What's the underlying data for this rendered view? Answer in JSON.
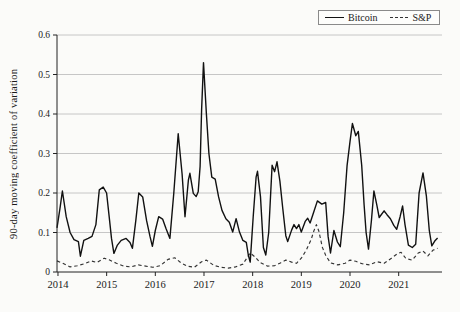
{
  "colors": {
    "background": "#fbfbf9",
    "bitcoin_line": "#111111",
    "sp_line": "#333333",
    "grid": "#c6c6c6",
    "axis": "#222222",
    "tick_text": "#1a1a1a",
    "legend_border": "#8a8a8a"
  },
  "chart_data": {
    "type": "line",
    "title": "",
    "xlabel": "",
    "ylabel": "90-day moving coefficient of variation",
    "xlim": [
      2013.98,
      2021.89
    ],
    "ylim": [
      0,
      0.6
    ],
    "x_ticks": [
      2014,
      2015,
      2016,
      2017,
      2018,
      2019,
      2020,
      2021
    ],
    "x_tick_labels": [
      "2014",
      "2015",
      "2016",
      "2017",
      "2018",
      "2019",
      "2020",
      "2021"
    ],
    "y_ticks": [
      0,
      0.1,
      0.2,
      0.3,
      0.4,
      0.5,
      0.6
    ],
    "y_tick_labels": [
      "0",
      "0.1",
      "0.2",
      "0.3",
      "0.4",
      "0.5",
      "0.6"
    ],
    "grid": "horizontal",
    "legend": {
      "position": "top-right",
      "entries": [
        {
          "label": "Bitcoin",
          "style": "solid"
        },
        {
          "label": "S&P",
          "style": "dashed"
        }
      ]
    },
    "series": [
      {
        "name": "S&P",
        "style": "dashed",
        "points": [
          [
            2013.98,
            0.028
          ],
          [
            2014.1,
            0.022
          ],
          [
            2014.25,
            0.013
          ],
          [
            2014.4,
            0.016
          ],
          [
            2014.55,
            0.021
          ],
          [
            2014.68,
            0.028
          ],
          [
            2014.8,
            0.024
          ],
          [
            2014.95,
            0.035
          ],
          [
            2015.05,
            0.031
          ],
          [
            2015.2,
            0.022
          ],
          [
            2015.35,
            0.015
          ],
          [
            2015.5,
            0.013
          ],
          [
            2015.65,
            0.018
          ],
          [
            2015.8,
            0.015
          ],
          [
            2015.95,
            0.012
          ],
          [
            2016.1,
            0.016
          ],
          [
            2016.26,
            0.032
          ],
          [
            2016.4,
            0.036
          ],
          [
            2016.52,
            0.024
          ],
          [
            2016.65,
            0.015
          ],
          [
            2016.8,
            0.012
          ],
          [
            2016.95,
            0.026
          ],
          [
            2017.05,
            0.03
          ],
          [
            2017.2,
            0.017
          ],
          [
            2017.35,
            0.012
          ],
          [
            2017.5,
            0.01
          ],
          [
            2017.65,
            0.013
          ],
          [
            2017.8,
            0.02
          ],
          [
            2017.95,
            0.048
          ],
          [
            2018.05,
            0.038
          ],
          [
            2018.15,
            0.024
          ],
          [
            2018.3,
            0.015
          ],
          [
            2018.45,
            0.016
          ],
          [
            2018.57,
            0.023
          ],
          [
            2018.68,
            0.03
          ],
          [
            2018.8,
            0.025
          ],
          [
            2018.9,
            0.022
          ],
          [
            2019.0,
            0.035
          ],
          [
            2019.1,
            0.055
          ],
          [
            2019.2,
            0.082
          ],
          [
            2019.26,
            0.105
          ],
          [
            2019.31,
            0.12
          ],
          [
            2019.36,
            0.103
          ],
          [
            2019.43,
            0.063
          ],
          [
            2019.5,
            0.042
          ],
          [
            2019.6,
            0.023
          ],
          [
            2019.75,
            0.018
          ],
          [
            2019.9,
            0.022
          ],
          [
            2020.0,
            0.03
          ],
          [
            2020.12,
            0.027
          ],
          [
            2020.25,
            0.021
          ],
          [
            2020.4,
            0.018
          ],
          [
            2020.55,
            0.026
          ],
          [
            2020.7,
            0.022
          ],
          [
            2020.85,
            0.035
          ],
          [
            2020.97,
            0.046
          ],
          [
            2021.05,
            0.05
          ],
          [
            2021.15,
            0.034
          ],
          [
            2021.28,
            0.03
          ],
          [
            2021.4,
            0.048
          ],
          [
            2021.5,
            0.053
          ],
          [
            2021.6,
            0.041
          ],
          [
            2021.7,
            0.055
          ],
          [
            2021.8,
            0.06
          ]
        ]
      },
      {
        "name": "Bitcoin",
        "style": "solid",
        "points": [
          [
            2013.98,
            0.112
          ],
          [
            2014.04,
            0.16
          ],
          [
            2014.09,
            0.205
          ],
          [
            2014.17,
            0.14
          ],
          [
            2014.25,
            0.1
          ],
          [
            2014.33,
            0.082
          ],
          [
            2014.42,
            0.077
          ],
          [
            2014.46,
            0.04
          ],
          [
            2014.53,
            0.08
          ],
          [
            2014.62,
            0.085
          ],
          [
            2014.7,
            0.09
          ],
          [
            2014.78,
            0.12
          ],
          [
            2014.85,
            0.208
          ],
          [
            2014.93,
            0.215
          ],
          [
            2015.0,
            0.2
          ],
          [
            2015.06,
            0.13
          ],
          [
            2015.1,
            0.085
          ],
          [
            2015.15,
            0.047
          ],
          [
            2015.22,
            0.068
          ],
          [
            2015.3,
            0.08
          ],
          [
            2015.4,
            0.085
          ],
          [
            2015.48,
            0.075
          ],
          [
            2015.53,
            0.06
          ],
          [
            2015.6,
            0.13
          ],
          [
            2015.66,
            0.2
          ],
          [
            2015.74,
            0.19
          ],
          [
            2015.82,
            0.13
          ],
          [
            2015.89,
            0.09
          ],
          [
            2015.94,
            0.065
          ],
          [
            2016.0,
            0.105
          ],
          [
            2016.07,
            0.14
          ],
          [
            2016.15,
            0.134
          ],
          [
            2016.22,
            0.11
          ],
          [
            2016.3,
            0.085
          ],
          [
            2016.38,
            0.2
          ],
          [
            2016.47,
            0.35
          ],
          [
            2016.55,
            0.248
          ],
          [
            2016.61,
            0.14
          ],
          [
            2016.68,
            0.233
          ],
          [
            2016.71,
            0.25
          ],
          [
            2016.78,
            0.199
          ],
          [
            2016.84,
            0.191
          ],
          [
            2016.88,
            0.203
          ],
          [
            2016.92,
            0.267
          ],
          [
            2016.95,
            0.41
          ],
          [
            2016.99,
            0.53
          ],
          [
            2017.05,
            0.4
          ],
          [
            2017.1,
            0.3
          ],
          [
            2017.16,
            0.24
          ],
          [
            2017.23,
            0.235
          ],
          [
            2017.3,
            0.19
          ],
          [
            2017.37,
            0.156
          ],
          [
            2017.45,
            0.135
          ],
          [
            2017.52,
            0.126
          ],
          [
            2017.59,
            0.101
          ],
          [
            2017.66,
            0.135
          ],
          [
            2017.73,
            0.101
          ],
          [
            2017.8,
            0.08
          ],
          [
            2017.87,
            0.075
          ],
          [
            2017.91,
            0.043
          ],
          [
            2017.95,
            0.025
          ],
          [
            2018.01,
            0.14
          ],
          [
            2018.07,
            0.24
          ],
          [
            2018.1,
            0.255
          ],
          [
            2018.16,
            0.19
          ],
          [
            2018.22,
            0.062
          ],
          [
            2018.27,
            0.043
          ],
          [
            2018.33,
            0.1
          ],
          [
            2018.4,
            0.27
          ],
          [
            2018.45,
            0.254
          ],
          [
            2018.5,
            0.279
          ],
          [
            2018.56,
            0.23
          ],
          [
            2018.62,
            0.16
          ],
          [
            2018.68,
            0.092
          ],
          [
            2018.72,
            0.077
          ],
          [
            2018.8,
            0.106
          ],
          [
            2018.85,
            0.12
          ],
          [
            2018.9,
            0.11
          ],
          [
            2018.95,
            0.12
          ],
          [
            2019.0,
            0.101
          ],
          [
            2019.08,
            0.128
          ],
          [
            2019.13,
            0.136
          ],
          [
            2019.18,
            0.124
          ],
          [
            2019.25,
            0.15
          ],
          [
            2019.33,
            0.18
          ],
          [
            2019.42,
            0.172
          ],
          [
            2019.5,
            0.176
          ],
          [
            2019.55,
            0.09
          ],
          [
            2019.6,
            0.048
          ],
          [
            2019.67,
            0.105
          ],
          [
            2019.74,
            0.076
          ],
          [
            2019.8,
            0.064
          ],
          [
            2019.87,
            0.15
          ],
          [
            2019.94,
            0.27
          ],
          [
            2020.0,
            0.33
          ],
          [
            2020.05,
            0.376
          ],
          [
            2020.12,
            0.345
          ],
          [
            2020.17,
            0.356
          ],
          [
            2020.24,
            0.27
          ],
          [
            2020.29,
            0.17
          ],
          [
            2020.33,
            0.1
          ],
          [
            2020.38,
            0.058
          ],
          [
            2020.44,
            0.13
          ],
          [
            2020.49,
            0.205
          ],
          [
            2020.55,
            0.17
          ],
          [
            2020.6,
            0.138
          ],
          [
            2020.7,
            0.155
          ],
          [
            2020.76,
            0.145
          ],
          [
            2020.83,
            0.135
          ],
          [
            2020.9,
            0.118
          ],
          [
            2020.96,
            0.108
          ],
          [
            2021.03,
            0.14
          ],
          [
            2021.08,
            0.167
          ],
          [
            2021.13,
            0.12
          ],
          [
            2021.2,
            0.068
          ],
          [
            2021.28,
            0.062
          ],
          [
            2021.35,
            0.07
          ],
          [
            2021.42,
            0.2
          ],
          [
            2021.5,
            0.251
          ],
          [
            2021.57,
            0.192
          ],
          [
            2021.63,
            0.105
          ],
          [
            2021.68,
            0.066
          ],
          [
            2021.75,
            0.08
          ],
          [
            2021.8,
            0.086
          ]
        ]
      }
    ]
  }
}
